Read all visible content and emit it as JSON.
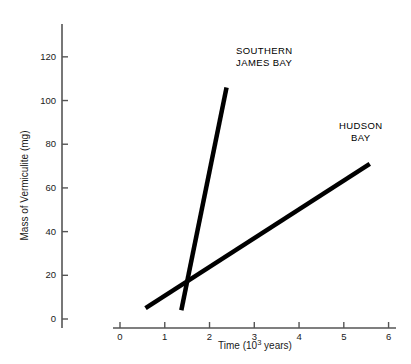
{
  "chart_data": {
    "type": "line",
    "title": "",
    "xlabel": "Time (10^3 years)",
    "xlabel_prefix": "Time (10",
    "xlabel_exponent": "3",
    "xlabel_suffix": " years)",
    "ylabel": "Mass of Vermiculite (mg)",
    "xlim": [
      0,
      6.3
    ],
    "ylim": [
      0,
      130
    ],
    "x_ticks": [
      0,
      1,
      2,
      3,
      4,
      5,
      6
    ],
    "x_tick_labels": [
      "0",
      "1",
      "2",
      "3",
      "4",
      "5",
      "6"
    ],
    "y_ticks": [
      0,
      20,
      40,
      60,
      80,
      100,
      120
    ],
    "y_tick_labels": [
      "0",
      "20",
      "40",
      "60",
      "80",
      "100",
      "120"
    ],
    "grid": false,
    "legend_position": "inline-annotation",
    "line_color": "#000000",
    "axis_color": "#555555",
    "series": [
      {
        "name": "SOUTHERN JAMES BAY",
        "label_line_1": "SOUTHERN",
        "label_line_2": "JAMES BAY",
        "x": [
          1.37,
          2.38
        ],
        "y": [
          4,
          106
        ],
        "slope": 101,
        "linewidth": 4.5
      },
      {
        "name": "HUDSON BAY",
        "label_line_1": "HUDSON",
        "label_line_2": "BAY",
        "x": [
          0.57,
          5.58
        ],
        "y": [
          5,
          71
        ],
        "slope": 13.2,
        "linewidth": 4.5
      }
    ],
    "annotations": [
      {
        "name": "intersection",
        "x": 1.45,
        "y": 16
      }
    ]
  }
}
